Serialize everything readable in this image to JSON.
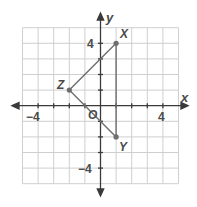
{
  "graph": {
    "x_axis_label": "x",
    "y_axis_label": "y",
    "origin_label": "O",
    "tick_labels": {
      "x_neg": "−4",
      "x_pos": "4",
      "y_pos": "4",
      "y_neg": "−4"
    },
    "range": {
      "xmin": -5,
      "xmax": 5,
      "ymin": -5,
      "ymax": 5
    },
    "points": [
      {
        "name": "X",
        "x": 1,
        "y": 4
      },
      {
        "name": "Y",
        "x": 1,
        "y": -2
      },
      {
        "name": "Z",
        "x": -2,
        "y": 1
      }
    ],
    "segments": [
      [
        "X",
        "Y"
      ],
      [
        "X",
        "Z"
      ],
      [
        "Z",
        "Y"
      ]
    ],
    "colors": {
      "grid": "#c8c8c8",
      "axis": "#3a3a3a",
      "shape": "#6e6e6e",
      "point": "#6e6e6e",
      "text": "#4a4a4a"
    }
  }
}
